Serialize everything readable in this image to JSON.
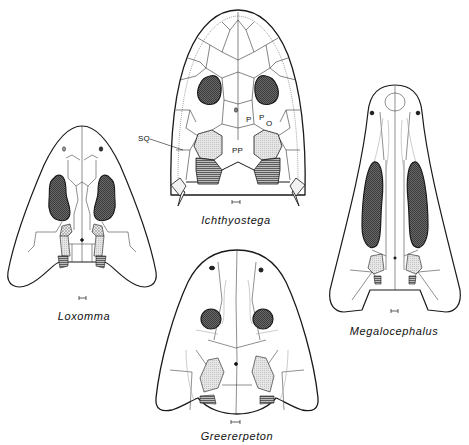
{
  "figure": {
    "colors": {
      "outline": "#1a1a1a",
      "suture": "#333333",
      "orbit_fill": "#555555",
      "light_shading": "#d9d9d9",
      "hatched_shading": "#8a8a8a",
      "background": "#ffffff"
    }
  },
  "skulls": [
    {
      "id": "ichthyostega",
      "name": "Ichthyostega",
      "bone_labels": [
        {
          "text": "SQ",
          "meaning": "squamosal"
        },
        {
          "text": "P",
          "meaning": "parietal"
        },
        {
          "text": "PO",
          "meaning": "postorbital"
        },
        {
          "text": "PP",
          "meaning": "postparietal"
        }
      ]
    },
    {
      "id": "loxomma",
      "name": "Loxomma"
    },
    {
      "id": "megalocephalus",
      "name": "Megalocephalus"
    },
    {
      "id": "greererpeton",
      "name": "Greererpeton"
    }
  ],
  "labels": {
    "sq": "SQ",
    "p": "P",
    "po_p": "P",
    "po_o": "O",
    "pp": "PP"
  }
}
